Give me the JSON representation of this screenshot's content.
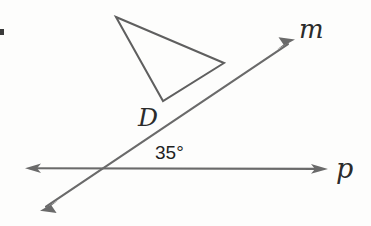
{
  "figure": {
    "background_color": "#fdfdfc",
    "stroke_color": "#6a6a6a",
    "triangle_stroke_color": "#5f5f5f",
    "text_color": "#2b2b2b",
    "width": 371,
    "height": 226
  },
  "labels": {
    "line_m": "m",
    "line_p": "p",
    "point_d": "D",
    "angle": "35°"
  },
  "geometry": {
    "type": "two-intersecting-lines-with-triangle",
    "line_p": {
      "name": "p",
      "kind": "double-headed-arrow",
      "x1": 26,
      "y1": 168,
      "x2": 327,
      "y2": 169
    },
    "line_m": {
      "name": "m",
      "kind": "double-headed-arrow",
      "x1": 41,
      "y1": 210,
      "x2": 294,
      "y2": 40
    },
    "intersection": {
      "x": 108,
      "y": 169
    },
    "angle_value_degrees": 35,
    "triangle": {
      "vertices": [
        {
          "x": 116,
          "y": 17
        },
        {
          "x": 224,
          "y": 63
        },
        {
          "x": 163,
          "y": 101
        }
      ]
    }
  }
}
